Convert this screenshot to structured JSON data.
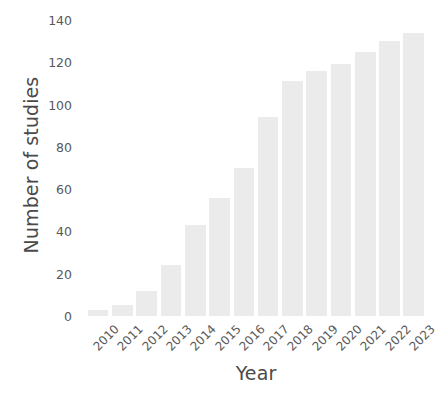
{
  "chart_data": {
    "type": "bar",
    "title": "",
    "subtitle": "",
    "xlabel": "Year",
    "ylabel": "Number of studies",
    "categories": [
      "2010",
      "2011",
      "2012",
      "2013",
      "2014",
      "2015",
      "2016",
      "2017",
      "2018",
      "2019",
      "2020",
      "2021",
      "2022",
      "2023"
    ],
    "values": [
      3,
      5,
      12,
      24,
      43,
      56,
      70,
      94,
      111,
      116,
      119,
      125,
      130,
      134
    ],
    "series": [
      {
        "name": "Number of studies",
        "values": [
          3,
          5,
          12,
          24,
          43,
          56,
          70,
          94,
          111,
          116,
          119,
          125,
          130,
          134
        ]
      }
    ],
    "ylim": [
      0,
      140
    ],
    "yticks": [
      0,
      20,
      40,
      60,
      80,
      100,
      120,
      140
    ],
    "ytick_labels": [
      "0",
      "20",
      "40",
      "60",
      "80",
      "100",
      "120",
      "140"
    ],
    "xtick_rotation": -45,
    "grid": false,
    "legend": false,
    "legend_position": "none",
    "bar_color": "#ebebeb",
    "background_color": "#ffffff",
    "axis_text_color": "#595959",
    "axis_title_color": "#4a4a4a"
  }
}
